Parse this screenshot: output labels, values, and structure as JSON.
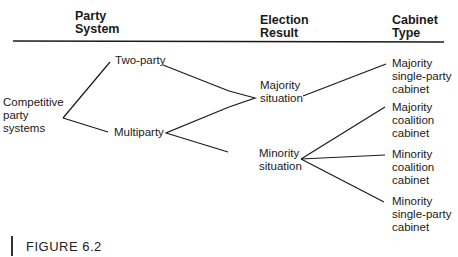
{
  "headers": {
    "party_system": "Party\nSystem",
    "election_result": "Election\nResult",
    "cabinet_type": "Cabinet\nType"
  },
  "nodes": {
    "root": "Competitive\nparty\nsystems",
    "two_party": "Two-party",
    "multiparty": "Multiparty",
    "majority_situation": "Majority\nsituation",
    "minority_situation": "Minority\nsituation",
    "majority_single_party": "Majority\nsingle-party\ncabinet",
    "majority_coalition": "Majority\ncoalition\ncabinet",
    "minority_coalition": "Minority\ncoalition\ncabinet",
    "minority_single_party": "Minority\nsingle-party\ncabinet"
  },
  "edges": [
    [
      "root",
      "two_party"
    ],
    [
      "root",
      "multiparty"
    ],
    [
      "two_party",
      "majority_situation"
    ],
    [
      "multiparty",
      "majority_situation"
    ],
    [
      "multiparty",
      "minority_situation"
    ],
    [
      "majority_situation",
      "majority_single_party"
    ],
    [
      "minority_situation",
      "majority_coalition"
    ],
    [
      "minority_situation",
      "minority_coalition"
    ],
    [
      "minority_situation",
      "minority_single_party"
    ]
  ],
  "caption": "FIGURE 6.2",
  "colors": {
    "line": "#1a1a1a",
    "text": "#1a1a1a",
    "background": "#ffffff"
  }
}
